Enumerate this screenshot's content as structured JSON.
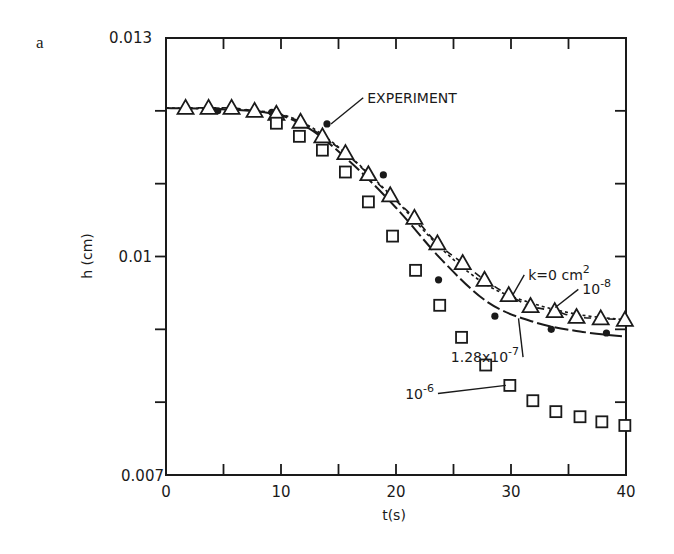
{
  "figure": {
    "panel_label": "a"
  },
  "chart_data": {
    "type": "scatter",
    "title": "",
    "xlabel": "t(s)",
    "ylabel": "h (cm)",
    "xlim": [
      0,
      40
    ],
    "ylim": [
      0.007,
      0.013
    ],
    "x_ticks": [
      0,
      5,
      10,
      15,
      20,
      25,
      30,
      35,
      40
    ],
    "x_tick_labels": [
      "0",
      "",
      "10",
      "",
      "20",
      "",
      "30",
      "",
      "40"
    ],
    "y_ticks": [
      0.007,
      0.008,
      0.009,
      0.01,
      0.011,
      0.012,
      0.013
    ],
    "y_tick_labels": [
      "0.007",
      "",
      "",
      "0.01",
      "",
      "",
      "0.013"
    ],
    "grid": false,
    "legend": "none (inline annotations)",
    "series": [
      {
        "name": "EXPERIMENT",
        "marker": "filled-circle",
        "x": [
          4.5,
          9.2,
          14.0,
          18.9,
          23.7,
          28.6,
          33.5,
          38.3
        ],
        "y": [
          0.012,
          0.01198,
          0.01182,
          0.01112,
          0.00968,
          0.00918,
          0.009,
          0.00895
        ]
      },
      {
        "name": "k=0 cm^2",
        "marker": "open-triangle",
        "line": "short-dash",
        "x": [
          1.7,
          3.7,
          5.7,
          7.7,
          9.6,
          11.7,
          13.6,
          15.6,
          17.6,
          19.5,
          21.6,
          23.6,
          25.8,
          27.7,
          29.8,
          31.7,
          33.8,
          35.7,
          37.8,
          39.9
        ],
        "y": [
          0.01204,
          0.01204,
          0.01204,
          0.012,
          0.01196,
          0.01185,
          0.01165,
          0.01142,
          0.01113,
          0.01084,
          0.01053,
          0.01018,
          0.00991,
          0.00968,
          0.00947,
          0.00932,
          0.00925,
          0.00917,
          0.00915,
          0.00913
        ]
      },
      {
        "name": "10^-8",
        "marker": "none",
        "line": "dotted",
        "x": [
          0,
          8,
          12,
          16,
          20,
          24,
          28,
          32,
          36,
          40
        ],
        "y": [
          0.01204,
          0.012,
          0.01183,
          0.01137,
          0.01077,
          0.0101,
          0.0096,
          0.00935,
          0.0092,
          0.00913
        ]
      },
      {
        "name": "1.28x10^-7",
        "marker": "none",
        "line": "long-dash / solid",
        "x": [
          0,
          8,
          12,
          16,
          20,
          24,
          28,
          32,
          36,
          40
        ],
        "y": [
          0.01204,
          0.01199,
          0.0118,
          0.0113,
          0.01067,
          0.00995,
          0.00937,
          0.0091,
          0.00897,
          0.0089
        ]
      },
      {
        "name": "10^-6",
        "marker": "open-square",
        "x": [
          9.6,
          11.6,
          13.6,
          15.6,
          17.6,
          19.7,
          21.7,
          23.8,
          25.7,
          27.8,
          29.9,
          31.9,
          33.9,
          36.0,
          37.9,
          39.9
        ],
        "y": [
          0.01183,
          0.01165,
          0.01146,
          0.01116,
          0.01075,
          0.01028,
          0.00981,
          0.00933,
          0.00889,
          0.00851,
          0.00823,
          0.00802,
          0.00787,
          0.0078,
          0.00773,
          0.00768
        ]
      }
    ],
    "annotations": [
      {
        "text": "EXPERIMENT",
        "at": [
          14.0,
          0.01182
        ],
        "label_pos": [
          17.5,
          0.01211
        ]
      },
      {
        "text": "k=0 cm",
        "sup": "2",
        "at": [
          29.8,
          0.00947
        ],
        "label_pos": [
          31.5,
          0.00968
        ]
      },
      {
        "text": "10",
        "sup": "-8",
        "at": [
          33.5,
          0.0093
        ],
        "label_pos": [
          36.2,
          0.00948
        ]
      },
      {
        "text": "1.28x10",
        "sup": "-7",
        "at": [
          31.0,
          0.00915
        ],
        "label_pos": [
          30.7,
          0.00855
        ]
      },
      {
        "text": "10",
        "sup": "-6",
        "at": [
          29.9,
          0.00823
        ],
        "label_pos": [
          23.3,
          0.00805
        ]
      }
    ]
  },
  "colors": {
    "ink": "#1a1a1a",
    "background": "#ffffff"
  }
}
